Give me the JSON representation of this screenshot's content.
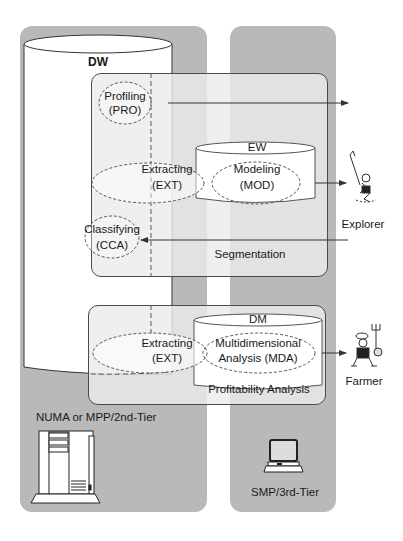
{
  "diagram": {
    "tiers": {
      "left": {
        "label": "NUMA or MPP/2nd-Tier",
        "icon": "server-tower-icon"
      },
      "right": {
        "label": "SMP/3rd-Tier",
        "icon": "desktop-computer-icon"
      }
    },
    "warehouse": {
      "label": "DW"
    },
    "segmentation": {
      "label": "Segmentation",
      "store": "EW",
      "processes": [
        {
          "name": "Profiling",
          "code": "(PRO)"
        },
        {
          "name": "Extracting",
          "code": "(EXT)"
        },
        {
          "name": "Modeling",
          "code": "(MOD)"
        },
        {
          "name": "Classifying",
          "code": "(CCA)"
        }
      ]
    },
    "profitability": {
      "label": "Profitability Analysis",
      "store": "DM",
      "processes": [
        {
          "name": "Extracting",
          "code": "(EXT)"
        },
        {
          "name": "Multidimensional",
          "code": "Analysis (MDA)"
        }
      ]
    },
    "users": [
      {
        "label": "Explorer",
        "icon": "explorer-figure-icon"
      },
      {
        "label": "Farmer",
        "icon": "farmer-figure-icon"
      }
    ],
    "colors": {
      "panel": "#b9b9b9",
      "box": "#e6e6e6",
      "cylinder": "#ffffff",
      "line": "#333333"
    }
  }
}
